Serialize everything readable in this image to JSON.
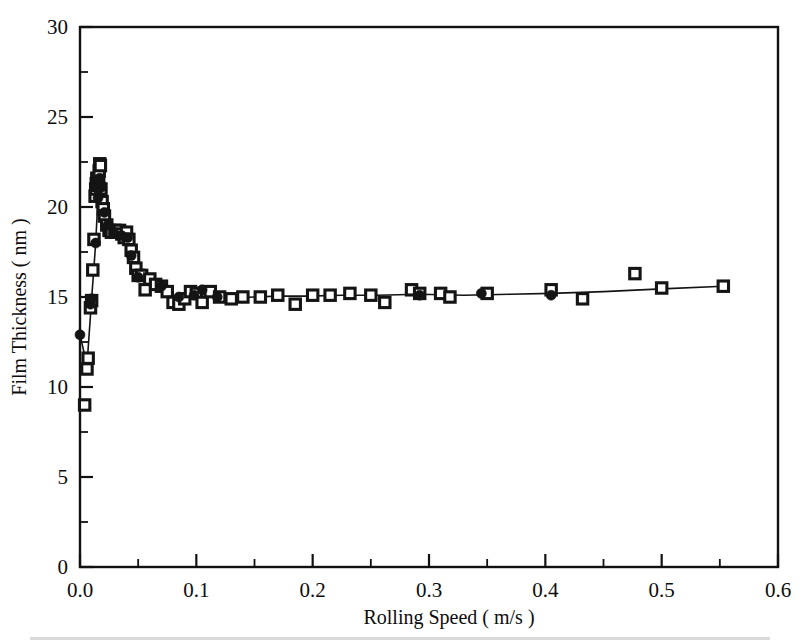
{
  "figure": {
    "background_color": "#ffffff",
    "ink_color": "#111111",
    "width": 804,
    "height": 644
  },
  "axes": {
    "x_label": "Rolling Speed     ( m/s )",
    "y_label": "Film Thickness     ( nm )",
    "x_tick_labels": [
      "0.0",
      "0.1",
      "0.2",
      "0.3",
      "0.4",
      "0.5",
      "0.6"
    ],
    "y_tick_labels": [
      "0",
      "5",
      "10",
      "15",
      "20",
      "25",
      "30"
    ]
  },
  "chart_data": {
    "type": "scatter",
    "title": "",
    "xlabel": "Rolling Speed     ( m/s )",
    "ylabel": "Film Thickness     ( nm )",
    "xlim": [
      0.0,
      0.6
    ],
    "ylim": [
      0,
      30
    ],
    "x_major_ticks": [
      0.0,
      0.1,
      0.2,
      0.3,
      0.4,
      0.5,
      0.6
    ],
    "x_minor_ticks": [
      0.05,
      0.15,
      0.25,
      0.35,
      0.45,
      0.55
    ],
    "y_major_ticks": [
      0,
      5,
      10,
      15,
      20,
      25,
      30
    ],
    "y_minor_ticks": [
      2.5,
      7.5,
      12.5,
      17.5,
      22.5,
      27.5
    ],
    "grid": false,
    "legend": false,
    "legend_position": "none",
    "series": [
      {
        "name": "open-square-series",
        "marker": "open-square",
        "x": [
          0.004,
          0.006,
          0.007,
          0.009,
          0.01,
          0.011,
          0.012,
          0.013,
          0.0135,
          0.014,
          0.0145,
          0.015,
          0.0155,
          0.016,
          0.0165,
          0.017,
          0.0175,
          0.018,
          0.019,
          0.02,
          0.021,
          0.023,
          0.025,
          0.027,
          0.03,
          0.032,
          0.034,
          0.036,
          0.038,
          0.04,
          0.042,
          0.044,
          0.046,
          0.048,
          0.05,
          0.053,
          0.056,
          0.06,
          0.065,
          0.07,
          0.075,
          0.08,
          0.085,
          0.09,
          0.095,
          0.1,
          0.105,
          0.112,
          0.12,
          0.13,
          0.14,
          0.155,
          0.17,
          0.185,
          0.2,
          0.215,
          0.232,
          0.25,
          0.262,
          0.285,
          0.292,
          0.31,
          0.318,
          0.35,
          0.405,
          0.432,
          0.477,
          0.5,
          0.553
        ],
        "y": [
          9.0,
          11.0,
          11.6,
          14.4,
          14.8,
          16.5,
          18.2,
          20.6,
          21.0,
          21.3,
          21.6,
          21.5,
          21.2,
          21.4,
          22.0,
          22.4,
          22.3,
          21.0,
          20.3,
          19.9,
          19.5,
          19.0,
          18.7,
          18.6,
          18.7,
          18.6,
          18.7,
          18.5,
          18.3,
          18.6,
          18.2,
          17.6,
          17.2,
          16.6,
          16.2,
          16.2,
          15.4,
          16.0,
          15.7,
          15.6,
          15.3,
          14.7,
          14.6,
          14.9,
          15.3,
          15.2,
          14.7,
          15.3,
          15.0,
          14.9,
          15.0,
          15.0,
          15.1,
          14.6,
          15.1,
          15.1,
          15.2,
          15.1,
          14.7,
          15.4,
          15.2,
          15.2,
          15.0,
          15.2,
          15.4,
          14.9,
          16.3,
          15.5,
          15.6
        ]
      },
      {
        "name": "filled-circle-series",
        "marker": "filled-circle",
        "x": [
          0.0,
          0.009,
          0.01,
          0.0135,
          0.0155,
          0.016,
          0.0165,
          0.017,
          0.0175,
          0.018,
          0.0185,
          0.021,
          0.024,
          0.036,
          0.041,
          0.044,
          0.05,
          0.07,
          0.085,
          0.098,
          0.105,
          0.118,
          0.292,
          0.345,
          0.405
        ],
        "y": [
          12.9,
          14.6,
          14.9,
          18.0,
          20.5,
          21.0,
          21.4,
          21.6,
          21.3,
          21.2,
          21.1,
          19.7,
          19.0,
          18.4,
          18.3,
          17.3,
          16.1,
          15.6,
          15.0,
          15.1,
          15.4,
          15.0,
          15.1,
          15.2,
          15.1
        ]
      }
    ],
    "trend_line": {
      "name": "fitted-curve",
      "x": [
        0.0,
        0.006,
        0.01,
        0.0135,
        0.016,
        0.0175,
        0.0195,
        0.021,
        0.024,
        0.028,
        0.033,
        0.038,
        0.042,
        0.046,
        0.05,
        0.056,
        0.062,
        0.07,
        0.078,
        0.086,
        0.094,
        0.105,
        0.118,
        0.132,
        0.15,
        0.17,
        0.195,
        0.225,
        0.255,
        0.292,
        0.33,
        0.37,
        0.405,
        0.45,
        0.5,
        0.553
      ],
      "y": [
        12.9,
        11.2,
        14.9,
        18.0,
        21.2,
        21.8,
        20.8,
        19.8,
        19.0,
        18.8,
        18.7,
        18.6,
        18.4,
        17.4,
        16.3,
        16.1,
        15.9,
        15.6,
        15.2,
        14.8,
        14.9,
        15.2,
        15.0,
        14.95,
        15.0,
        15.05,
        15.05,
        15.1,
        15.1,
        15.15,
        15.1,
        15.15,
        15.2,
        15.3,
        15.45,
        15.6
      ]
    },
    "annotations": []
  }
}
